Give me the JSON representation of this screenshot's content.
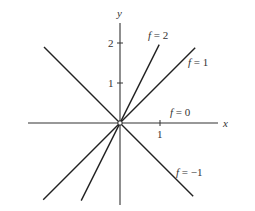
{
  "axes": {
    "x_label": "x",
    "y_label": "y",
    "x_ticks": [
      {
        "value": 1,
        "label": "1"
      }
    ],
    "y_ticks": [
      {
        "value": 1,
        "label": "1"
      },
      {
        "value": 2,
        "label": "2"
      }
    ],
    "x_range": [
      -2.3,
      2.45
    ],
    "y_range": [
      -2.05,
      2.5
    ]
  },
  "level_lines": [
    {
      "f": 2,
      "label_name": "f",
      "label_eq": " = 2",
      "slope": 2,
      "x_range": [
        -0.97,
        0.98
      ]
    },
    {
      "f": 1,
      "label_name": "f",
      "label_eq": " = 1",
      "slope": 1,
      "x_range": [
        -1.92,
        1.88
      ]
    },
    {
      "f": 0,
      "label_name": "f",
      "label_eq": " = 0",
      "slope": 0,
      "x_range": [
        -2.3,
        2.45
      ]
    },
    {
      "f": -1,
      "label_name": "f",
      "label_eq": " = −1",
      "slope": -1,
      "x_range": [
        -1.9,
        1.83
      ]
    }
  ],
  "origin_marker": "open-circle"
}
